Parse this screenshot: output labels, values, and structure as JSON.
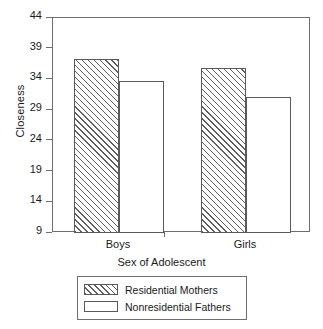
{
  "chart_data": {
    "type": "bar",
    "title": "",
    "xlabel": "Sex of Adolescent",
    "ylabel": "Closeness",
    "categories": [
      "Boys",
      "Girls"
    ],
    "series": [
      {
        "name": "Residential Mothers",
        "values": [
          37.3,
          35.8
        ],
        "fill": "hatched"
      },
      {
        "name": "Nonresidential Fathers",
        "values": [
          33.8,
          31.1
        ],
        "fill": "open"
      }
    ],
    "ylim": [
      9,
      44
    ],
    "yticks": [
      9,
      14,
      19,
      24,
      29,
      34,
      39,
      44
    ],
    "ytick_labels": [
      "9",
      "14",
      "19",
      "24",
      "29",
      "34",
      "39",
      "44"
    ],
    "grid": false,
    "legend_position": "below-axis",
    "colors": {
      "axis": "#6e6e6e",
      "bar_edge": "#5a5a5a",
      "hatch": "#5f5f5f",
      "background": "#ffffff",
      "text": "#1a1a1a"
    }
  }
}
